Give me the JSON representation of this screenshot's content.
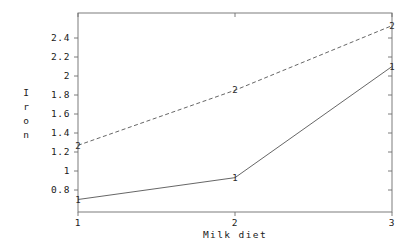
{
  "chart_data": {
    "type": "line",
    "title": "",
    "subtitle": "",
    "xlabel": "Milk diet",
    "ylabel": "Iron",
    "x": [
      1,
      2,
      3
    ],
    "xtick_labels": [
      "1",
      "2",
      "3"
    ],
    "ytick_labels": [
      "0.8",
      "1",
      "1.2",
      "1.4",
      "1.6",
      "1.8",
      "2",
      "2.2",
      "2.4"
    ],
    "ytick_values": [
      0.8,
      1,
      1.2,
      1.4,
      1.6,
      1.8,
      2,
      2.2,
      2.4
    ],
    "xlim": [
      1,
      3
    ],
    "ylim": [
      0.6,
      2.55
    ],
    "grid": false,
    "legend": "none",
    "frame": "box",
    "series": [
      {
        "name": "1",
        "marker_label": "1",
        "linestyle": "solid",
        "color": "#555555",
        "values": [
          0.7,
          0.93,
          2.1
        ]
      },
      {
        "name": "2",
        "marker_label": "2",
        "linestyle": "dashed",
        "color": "#555555",
        "values": [
          1.27,
          1.85,
          2.53
        ]
      }
    ],
    "annotations": []
  },
  "style": {
    "background": "#ffffff",
    "axis_color": "#6e6e6e",
    "text_color": "#1a1a1a"
  },
  "ylabel_letters": [
    "I",
    "r",
    "o",
    "n"
  ]
}
